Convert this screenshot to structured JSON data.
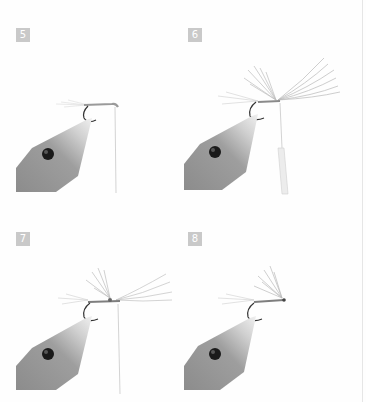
{
  "page": {
    "background": "#fefefe",
    "edge_line_color": "#e6e6e6"
  },
  "steps": [
    {
      "number": "5",
      "stage": "thread-wrapped-body",
      "has_hackle_front": false,
      "has_bobbin": false
    },
    {
      "number": "6",
      "stage": "hackle-tied-in",
      "has_hackle_front": true,
      "has_bobbin": true
    },
    {
      "number": "7",
      "stage": "hackle-wound",
      "has_hackle_front": true,
      "has_bobbin": false
    },
    {
      "number": "8",
      "stage": "finished-fly",
      "has_hackle_front": false,
      "has_bobbin": false
    }
  ],
  "colors": {
    "badge_bg": "#c9c9c9",
    "badge_text": "#ffffff",
    "vise_dark": "#8f8f8f",
    "vise_light": "#e2e2e2",
    "vise_screw": "#1a1a1a",
    "hook": "#3a3a3a",
    "hackle": "#9a9a9a",
    "thread": "#c8c8c8"
  }
}
